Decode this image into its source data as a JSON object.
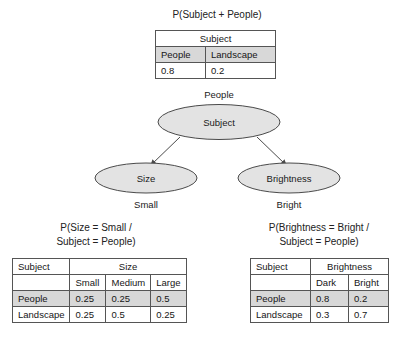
{
  "top_section": {
    "title": "P(Subject + People)",
    "table": {
      "header_span": "Subject",
      "columns": [
        "People",
        "Landscape"
      ],
      "values": [
        "0.8",
        "0.2"
      ]
    }
  },
  "network": {
    "root_state_label": "People",
    "root_node": "Subject",
    "children": [
      {
        "node": "Size",
        "state_label": "Small"
      },
      {
        "node": "Brightness",
        "state_label": "Bright"
      }
    ],
    "node_fill": "#e3e3e3",
    "node_stroke": "#4a4a4a"
  },
  "bottom_left": {
    "caption_line1": "P(Size = Small /",
    "caption_line2": "Subject = People)",
    "table": {
      "corner_header": "Subject",
      "group_header": "Size",
      "sub_headers": [
        "Small",
        "Medium",
        "Large"
      ],
      "rows": [
        {
          "label": "People",
          "values": [
            "0.25",
            "0.25",
            "0.5"
          ],
          "shaded": true
        },
        {
          "label": "Landscape",
          "values": [
            "0.25",
            "0.5",
            "0.25"
          ],
          "shaded": false
        }
      ]
    }
  },
  "bottom_right": {
    "caption_line1": "P(Brightness = Bright /",
    "caption_line2": "Subject = People)",
    "table": {
      "corner_header": "Subject",
      "group_header": "Brightness",
      "sub_headers": [
        "Dark",
        "Bright"
      ],
      "rows": [
        {
          "label": "People",
          "values": [
            "0.8",
            "0.2"
          ],
          "shaded": true
        },
        {
          "label": "Landscape",
          "values": [
            "0.3",
            "0.7"
          ],
          "shaded": false
        }
      ]
    }
  },
  "colors": {
    "shaded_row": "#d8d8d8",
    "border": "#555555",
    "text": "#1a1a1a"
  }
}
